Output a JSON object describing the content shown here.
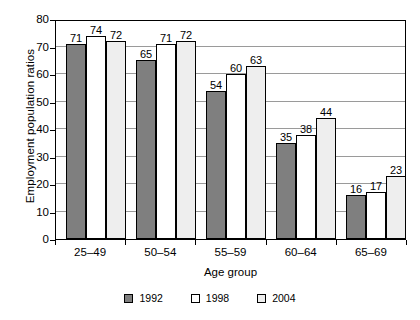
{
  "chart_data": {
    "type": "bar",
    "title": "",
    "xlabel": "Age group",
    "ylabel": "Employment population ratios",
    "categories": [
      "25–49",
      "50–54",
      "55–59",
      "60–64",
      "65–69"
    ],
    "series": [
      {
        "name": "1992",
        "color": "#7f7f7f",
        "values": [
          71,
          65,
          54,
          35,
          16
        ]
      },
      {
        "name": "1998",
        "color": "#ffffff",
        "values": [
          74,
          71,
          60,
          38,
          17
        ]
      },
      {
        "name": "2004",
        "color": "#eeeeee",
        "values": [
          72,
          72,
          63,
          44,
          23
        ]
      }
    ],
    "ylim": [
      0,
      80
    ],
    "yticks": [
      0,
      10,
      20,
      30,
      40,
      50,
      60,
      70,
      80
    ],
    "ytick_labels": [
      "0",
      "10",
      "20",
      "30",
      "40",
      "50",
      "60",
      "70",
      "80"
    ],
    "grid": "horizontal",
    "legend_position": "bottom",
    "data_labels": true
  }
}
